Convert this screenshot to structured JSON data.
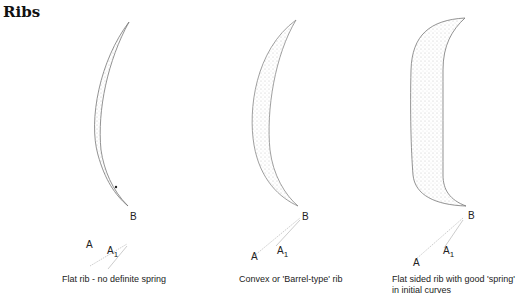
{
  "heading": "Ribs",
  "figures": [
    {
      "label_B": "B",
      "label_A": "A",
      "label_A1": "A",
      "label_A1_sub": "1",
      "caption": "Flat rib - no definite spring"
    },
    {
      "label_B": "B",
      "label_A": "A",
      "label_A1": "A",
      "label_A1_sub": "1",
      "caption": "Convex or 'Barrel-type' rib"
    },
    {
      "label_B": "B",
      "label_A": "A",
      "label_A1": "A",
      "label_A1_sub": "1",
      "caption_line1": "Flat sided rib with good 'spring'",
      "caption_line2": "in initial curves"
    }
  ]
}
